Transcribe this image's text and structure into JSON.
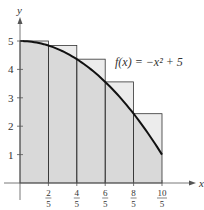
{
  "chart_data": {
    "type": "area",
    "title": "",
    "function_label": "f(x) = −x² + 5",
    "xlabel": "x",
    "ylabel": "y",
    "xlim": [
      0,
      2.2
    ],
    "ylim": [
      0,
      5.5
    ],
    "x_ticks": [
      {
        "num": "2",
        "den": "5",
        "value": 0.4
      },
      {
        "num": "4",
        "den": "5",
        "value": 0.8
      },
      {
        "num": "6",
        "den": "5",
        "value": 1.2
      },
      {
        "num": "8",
        "den": "5",
        "value": 1.6
      },
      {
        "num": "10",
        "den": "5",
        "value": 2.0
      }
    ],
    "y_ticks": [
      "1",
      "2",
      "3",
      "4",
      "5"
    ],
    "curve": {
      "expression": "-x^2 + 5",
      "x_range": [
        0,
        2
      ]
    },
    "rectangles": [
      {
        "x0": 0.0,
        "x1": 0.4,
        "height": 5.0
      },
      {
        "x0": 0.4,
        "x1": 0.8,
        "height": 4.84
      },
      {
        "x0": 0.8,
        "x1": 1.2,
        "height": 4.36
      },
      {
        "x0": 1.2,
        "x1": 1.6,
        "height": 3.56
      },
      {
        "x0": 1.6,
        "x1": 2.0,
        "height": 2.44
      }
    ],
    "grid": false,
    "legend": "none"
  },
  "colors": {
    "region_fill": "#d9d9d9",
    "rect_fill": "#ececec",
    "curve": "#111111",
    "axis": "#555555"
  }
}
